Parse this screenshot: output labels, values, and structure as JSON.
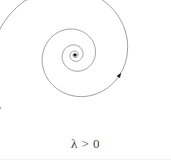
{
  "figure": {
    "width": 171,
    "height": 163,
    "background_color": "#ffffff",
    "stroke_color": "#6b6b6b",
    "stroke_width": 0.7,
    "caption": "λ > 0",
    "caption_color": "#444444",
    "fixed_point": {
      "label": "origin-fixed-point",
      "x": 75,
      "y": 55,
      "color": "#1a1a1a",
      "radius": 1.6
    },
    "arrow": {
      "label": "direction-arrowhead",
      "x": 148,
      "y": 94,
      "color": "#1a1a1a",
      "direction": "outward-counterclockwise"
    },
    "spiral": {
      "type": "logarithmic-spiral",
      "center_x": 75,
      "center_y": 55,
      "turns": 4.6,
      "start_radius": 1.2,
      "end_radius": 92,
      "growth": "exponential",
      "start_angle_deg": 0,
      "sweep_direction": "counterclockwise-outward",
      "end_point_x": 161,
      "end_point_y": 37,
      "extrema": {
        "top_y": 3,
        "left_x": 10,
        "bottom_y": 126,
        "right_x": 164
      }
    }
  },
  "chart_data": {
    "type": "line",
    "title": "λ > 0",
    "xlabel": "",
    "ylabel": "",
    "annotations": [
      "λ > 0"
    ],
    "series": [
      {
        "name": "unstable-spiral-trajectory",
        "parametric": true,
        "formula": "r(t) = a * exp(b t), theta(t) = t",
        "a": 1.2,
        "b": 0.15,
        "t_range": [
          0,
          28.9
        ],
        "center": [
          75,
          55
        ]
      }
    ],
    "legend": "none",
    "grid": false
  }
}
